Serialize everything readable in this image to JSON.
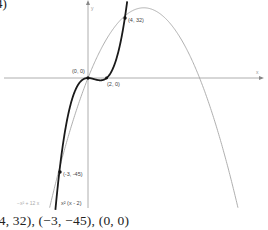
{
  "problem": {
    "number_label": "4)",
    "answer_text": "(4, 32), (−3, −45), (0, 0)"
  },
  "chart_data": {
    "type": "line",
    "title": "",
    "xlabel": "x",
    "ylabel": "y",
    "grid": false,
    "series": [
      {
        "name": "x² (x - 2)",
        "expression": "x^3 - 2x^2",
        "style": "thick dark",
        "color": "#1a1a1a"
      },
      {
        "name": "−x² + 12x",
        "expression": "-x^2 + 12x",
        "style": "thin gray",
        "color": "#a6a6a6"
      }
    ],
    "points": [
      {
        "label": "(4, 32)",
        "x": 4,
        "y": 32
      },
      {
        "label": "(0, 0)",
        "x": 0,
        "y": 0
      },
      {
        "label": "(2, 0)",
        "x": 2,
        "y": 0
      },
      {
        "label": "(-3, -45)",
        "x": -3,
        "y": -45
      }
    ],
    "xlim": [
      -9.5,
      18.8
    ],
    "ylim": [
      -67,
      40
    ]
  },
  "labels": {
    "p1": "(4, 32)",
    "p2": "(0, 0)",
    "p3": "(2, 0)",
    "p4": "(-3, -45)",
    "cubic": "x² (x - 2)",
    "parabola": "−x² + 12 x",
    "x_axis": "x",
    "y_axis": "y"
  },
  "colors": {
    "cubic": "#1a1a1a",
    "parabola": "#a6a6a6",
    "axis": "#9a9a9a"
  }
}
